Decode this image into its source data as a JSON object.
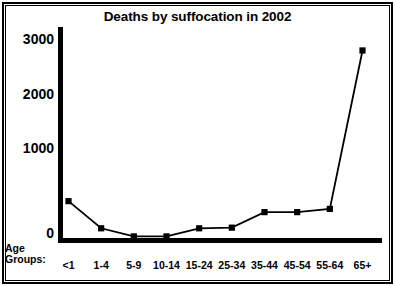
{
  "chart_data": {
    "type": "line",
    "title": "Deaths by suffocation in 2002",
    "xlabel": "Age Groups:",
    "ylabel": "",
    "categories": [
      "<1",
      "1-4",
      "5-9",
      "10-14",
      "15-24",
      "25-34",
      "35-44",
      "45-54",
      "55-64",
      "65+"
    ],
    "values": [
      570,
      150,
      25,
      25,
      150,
      160,
      400,
      400,
      450,
      2900
    ],
    "series": [
      {
        "name": "Deaths",
        "values": [
          570,
          150,
          25,
          25,
          150,
          160,
          400,
          400,
          450,
          2900
        ]
      }
    ],
    "ylim": [
      0,
      3000
    ],
    "yticks": [
      0,
      1000,
      2000,
      3000
    ],
    "ytick_labels": [
      "0",
      "1000",
      "2000",
      "3000"
    ],
    "grid": false,
    "legend": false,
    "marker": "square",
    "line_color": "#000000",
    "marker_color": "#000000",
    "background": "#ffffff"
  },
  "axis": {
    "caption_line1": "Age",
    "caption_line2": "Groups:"
  }
}
